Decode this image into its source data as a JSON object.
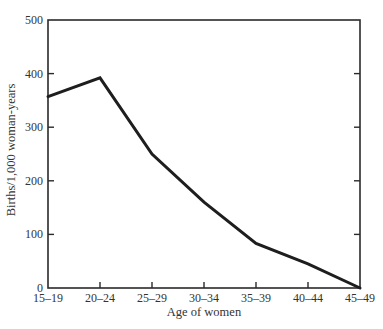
{
  "chart_data": {
    "type": "line",
    "title": "",
    "xlabel": "Age of women",
    "ylabel": "Births/1,000 woman-years",
    "categories": [
      "15–19",
      "20–24",
      "25–29",
      "30–34",
      "35–39",
      "40–44",
      "45–49"
    ],
    "series": [
      {
        "name": "Births/1,000 woman-years",
        "values": [
          357,
          392,
          250,
          160,
          83,
          45,
          0
        ]
      }
    ],
    "ylim": [
      0,
      500
    ],
    "yticks": [
      0,
      100,
      200,
      300,
      400,
      500
    ],
    "grid": false,
    "legend": "none",
    "frame": "box",
    "line_color": "#1e1e1e"
  },
  "axes": {
    "x_title": "Age of women",
    "y_title": "Births/1,000 woman-years",
    "y_tick_labels": [
      "0",
      "100",
      "200",
      "300",
      "400",
      "500"
    ],
    "x_tick_labels": [
      "15–19",
      "20–24",
      "25–29",
      "30–34",
      "35–39",
      "40–44",
      "45–49"
    ]
  }
}
